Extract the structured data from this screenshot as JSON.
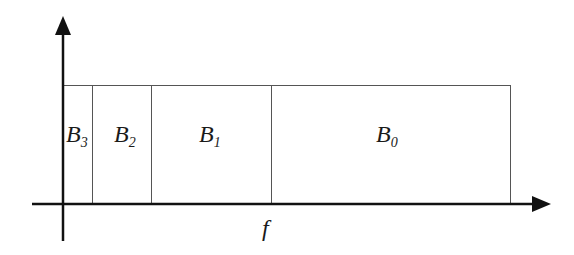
{
  "diagram": {
    "type": "frequency-band-partition",
    "axes": {
      "x": {
        "label": "f"
      },
      "y": {
        "label": ""
      }
    },
    "bands": [
      {
        "name": "B",
        "sub": "3",
        "x0": 63,
        "x1": 92
      },
      {
        "name": "B",
        "sub": "2",
        "x0": 92,
        "x1": 151
      },
      {
        "name": "B",
        "sub": "1",
        "x0": 151,
        "x1": 271
      },
      {
        "name": "B",
        "sub": "0",
        "x0": 271,
        "x1": 510
      }
    ],
    "colors": {
      "axis": "#111111",
      "band_border": "#555555",
      "text": "#1a1a1a"
    }
  }
}
